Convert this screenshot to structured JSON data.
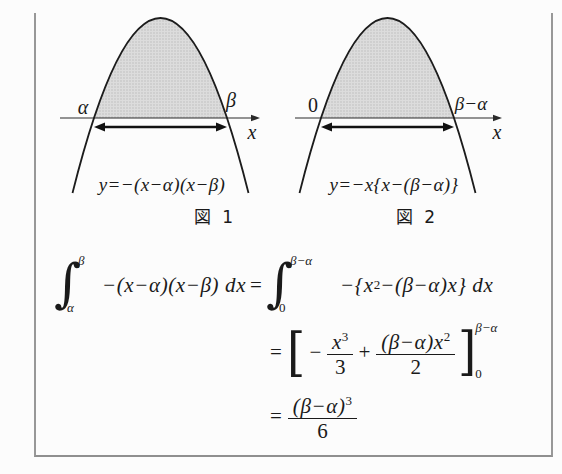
{
  "colors": {
    "background": "#fcfcfc",
    "frame": "#989898",
    "curve": "#1c1c1c",
    "shade_fill": "#dcdcdc",
    "shade_dot": "#c0c0c0",
    "text": "#1a1a1a"
  },
  "figure1": {
    "caption": "図 1",
    "equation": "y=−(x−α)(x−β)",
    "label_left_root": "α",
    "label_right_root": "β",
    "axis_label": "x"
  },
  "figure2": {
    "caption": "図 2",
    "equation": "y=−x{x−(β−α)}",
    "label_left_root": "0",
    "label_right_root": "β−α",
    "axis_label": "x"
  },
  "derivation": {
    "integral_sign": "∫",
    "line1": {
      "lhs_upper": "β",
      "lhs_lower": "α",
      "lhs_body": "−(x−α)(x−β) dx",
      "equals": "=",
      "rhs_upper": "β−α",
      "rhs_lower": "0",
      "rhs_body_pre": "−{x",
      "rhs_sup": "2",
      "rhs_body_post": "−(β−α)x} dx"
    },
    "line2": {
      "equals": "=",
      "open_bracket": "[",
      "term1_sign": "−",
      "frac1_num_base": "x",
      "frac1_num_sup": "3",
      "frac1_den": "3",
      "plus": "+",
      "frac2_num_base": "(β−α)x",
      "frac2_num_sup": "2",
      "frac2_den": "2",
      "close_bracket": "]",
      "bracket_upper": "β−α",
      "bracket_lower": "0"
    },
    "line3": {
      "equals": "=",
      "frac_num_base": "(β−α)",
      "frac_num_sup": "3",
      "frac_den": "6"
    }
  }
}
